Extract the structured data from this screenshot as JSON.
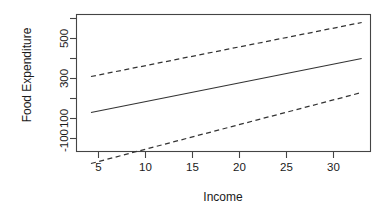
{
  "chart_data": {
    "type": "line",
    "title": "",
    "xlabel": "Income",
    "ylabel": "Food Expenditure",
    "xlim": [
      3.3,
      33.6
    ],
    "ylim": [
      -160,
      620
    ],
    "grid": false,
    "legend": "none",
    "x_ticks": [
      5,
      10,
      15,
      20,
      25,
      30
    ],
    "x_tick_labels": [
      "5",
      "10",
      "15",
      "20",
      "25",
      "30"
    ],
    "y_ticks": [
      -100,
      0,
      100,
      200,
      300,
      400,
      500
    ],
    "y_tick_labels": [
      "-100",
      "",
      "100",
      "",
      "300",
      "",
      "500"
    ],
    "y_labeled_ticks": [
      -100,
      100,
      300,
      500
    ],
    "y_labeled_tick_labels": [
      "-100",
      "100",
      "300",
      "500"
    ],
    "series": [
      {
        "name": "fitted-regression-line",
        "style": "solid",
        "x": [
          4.2,
          33.0
        ],
        "values": [
          130,
          400
        ]
      },
      {
        "name": "upper-prediction-interval",
        "style": "dashed",
        "x": [
          4.2,
          33.0
        ],
        "values": [
          310,
          580
        ]
      },
      {
        "name": "lower-prediction-interval",
        "style": "dashed",
        "x": [
          4.2,
          33.0
        ],
        "values": [
          -125,
          230
        ]
      }
    ]
  },
  "axes": {
    "x_title": "Income",
    "y_title": "Food Expenditure",
    "x_tick_labels": [
      "5",
      "10",
      "15",
      "20",
      "25",
      "30"
    ],
    "y_tick_labels": [
      "500",
      "300",
      "100",
      "-100"
    ]
  },
  "colors": {
    "line": "#333333",
    "frame": "#444444",
    "text": "#1a1a1a",
    "background": "#ffffff"
  }
}
